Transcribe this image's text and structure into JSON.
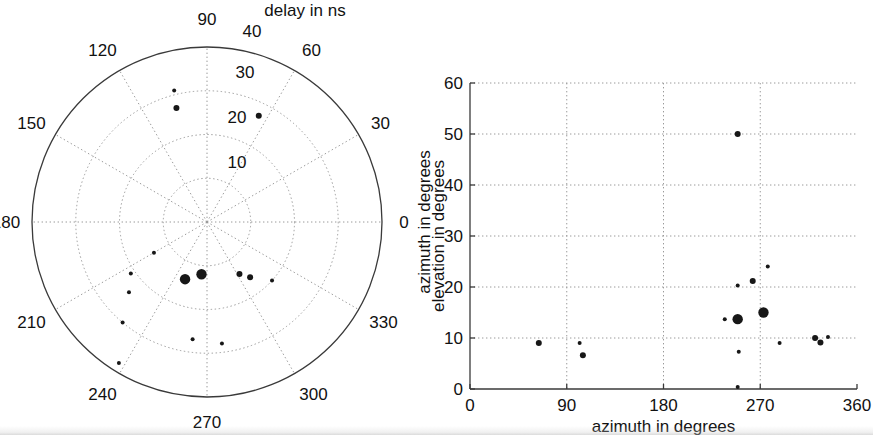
{
  "figure": {
    "width": 873,
    "height": 435,
    "background": "#ffffff",
    "ink_color": "#171717",
    "grid_color": "#9a9a9a",
    "axis_color": "#3a3a3a"
  },
  "chart_data": [
    {
      "id": "polar-delay-azimuth",
      "type": "scatter",
      "coordinate_system": "polar",
      "title": "delay in ns",
      "radial_axis_label": "delay in ns",
      "angular_axis_label": "azimuth in degrees",
      "radial_ticks": [
        10,
        20,
        30,
        40
      ],
      "radial_tick_labels": [
        "10",
        "20",
        "30",
        "40"
      ],
      "rlim": [
        0,
        40
      ],
      "angular_ticks": [
        0,
        30,
        60,
        90,
        120,
        150,
        180,
        210,
        240,
        270,
        300,
        330
      ],
      "angular_tick_labels": [
        "0",
        "30",
        "60",
        "90",
        "120",
        "150",
        "180",
        "210",
        "240",
        "270",
        "300",
        "330"
      ],
      "angular_direction": "counterclockwise",
      "zero_angle_position": "east",
      "grid": true,
      "legend": "none",
      "points": [
        {
          "azimuth_deg": 104,
          "delay_ns": 31,
          "size": "tiny"
        },
        {
          "azimuth_deg": 105,
          "delay_ns": 27,
          "size": "small"
        },
        {
          "azimuth_deg": 64,
          "delay_ns": 27,
          "size": "small"
        },
        {
          "azimuth_deg": 249,
          "delay_ns": 14,
          "size": "large"
        },
        {
          "azimuth_deg": 264,
          "delay_ns": 12,
          "size": "large"
        },
        {
          "azimuth_deg": 210,
          "delay_ns": 14,
          "size": "tiny"
        },
        {
          "azimuth_deg": 302,
          "delay_ns": 14,
          "size": "small"
        },
        {
          "azimuth_deg": 308,
          "delay_ns": 16,
          "size": "small"
        },
        {
          "azimuth_deg": 318,
          "delay_ns": 20,
          "size": "tiny"
        },
        {
          "azimuth_deg": 214,
          "delay_ns": 21,
          "size": "tiny"
        },
        {
          "azimuth_deg": 222,
          "delay_ns": 24,
          "size": "tiny"
        },
        {
          "azimuth_deg": 230,
          "delay_ns": 30,
          "size": "tiny"
        },
        {
          "azimuth_deg": 263,
          "delay_ns": 27,
          "size": "tiny"
        },
        {
          "azimuth_deg": 277,
          "delay_ns": 28,
          "size": "tiny"
        },
        {
          "azimuth_deg": 238,
          "delay_ns": 38,
          "size": "tiny"
        }
      ]
    },
    {
      "id": "cartesian-azimuth-elevation",
      "type": "scatter",
      "coordinate_system": "cartesian",
      "xlabel": "azimuth in degrees",
      "ylabel": "elevation in degrees",
      "xlim": [
        0,
        360
      ],
      "ylim": [
        0,
        60
      ],
      "xticks": [
        0,
        90,
        180,
        270,
        360
      ],
      "xtick_labels": [
        "0",
        "90",
        "180",
        "270",
        "360"
      ],
      "yticks": [
        0,
        10,
        20,
        30,
        40,
        50,
        60
      ],
      "ytick_labels": [
        "0",
        "10",
        "20",
        "30",
        "40",
        "50",
        "60"
      ],
      "grid": true,
      "legend": "none",
      "points": [
        {
          "azimuth_deg": 64,
          "elevation_deg": 9.0,
          "size": "small"
        },
        {
          "azimuth_deg": 102,
          "elevation_deg": 9.0,
          "size": "tiny"
        },
        {
          "azimuth_deg": 105,
          "elevation_deg": 6.6,
          "size": "small"
        },
        {
          "azimuth_deg": 249,
          "elevation_deg": 50.0,
          "size": "small"
        },
        {
          "azimuth_deg": 277,
          "elevation_deg": 24.0,
          "size": "tiny"
        },
        {
          "azimuth_deg": 263,
          "elevation_deg": 21.2,
          "size": "small"
        },
        {
          "azimuth_deg": 249,
          "elevation_deg": 20.3,
          "size": "tiny"
        },
        {
          "azimuth_deg": 273,
          "elevation_deg": 15.0,
          "size": "large"
        },
        {
          "azimuth_deg": 249,
          "elevation_deg": 13.7,
          "size": "large"
        },
        {
          "azimuth_deg": 237,
          "elevation_deg": 13.7,
          "size": "tiny"
        },
        {
          "azimuth_deg": 321,
          "elevation_deg": 10.0,
          "size": "small"
        },
        {
          "azimuth_deg": 333,
          "elevation_deg": 10.2,
          "size": "tiny"
        },
        {
          "azimuth_deg": 326,
          "elevation_deg": 9.1,
          "size": "small"
        },
        {
          "azimuth_deg": 288,
          "elevation_deg": 9.0,
          "size": "tiny"
        },
        {
          "azimuth_deg": 250,
          "elevation_deg": 7.3,
          "size": "tiny"
        },
        {
          "azimuth_deg": 249,
          "elevation_deg": 0.4,
          "size": "tiny"
        }
      ]
    }
  ]
}
